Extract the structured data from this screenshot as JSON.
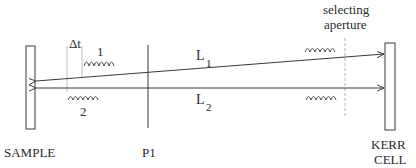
{
  "diagram": {
    "type": "optical-setup",
    "components": {
      "sample": {
        "label": "SAMPLE"
      },
      "polarizer": {
        "label": "P1"
      },
      "kerr_cell": {
        "label_line1": "KERR",
        "label_line2": "CELL"
      },
      "aperture": {
        "label_line1": "selecting",
        "label_line2": "aperture"
      }
    },
    "paths": {
      "l1": {
        "label": "L",
        "subscript": "1"
      },
      "l2": {
        "label": "L",
        "subscript": "2"
      }
    },
    "pulses": {
      "pulse1": {
        "label": "1"
      },
      "pulse2": {
        "label": "2"
      }
    },
    "delay": {
      "label": "Δt"
    },
    "colors": {
      "line": "#3a3a3a",
      "dashed": "#b0b0b0",
      "text": "#2a2a2a"
    }
  }
}
